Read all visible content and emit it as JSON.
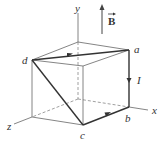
{
  "figure": {
    "type": "3d-cube-current-loop",
    "axes": {
      "x_label": "x",
      "y_label": "y",
      "z_label": "z"
    },
    "field": {
      "label": "B",
      "vector": true,
      "direction": "+y"
    },
    "current": {
      "label": "I",
      "path": [
        "a",
        "b",
        "c",
        "d",
        "a"
      ]
    },
    "vertices": {
      "a": "a",
      "b": "b",
      "c": "c",
      "d": "d"
    },
    "colors": {
      "edge": "#555555",
      "loop": "#333333",
      "hidden": "#777777",
      "background": "#ffffff"
    }
  }
}
